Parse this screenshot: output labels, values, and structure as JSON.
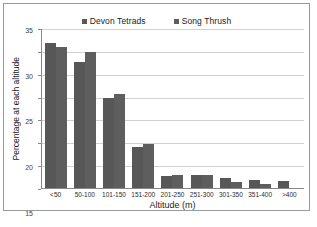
{
  "chart_data": {
    "type": "bar",
    "title": "",
    "xlabel": "Altitude (m)",
    "ylabel": "Percentage at each altitude",
    "categories": [
      "<50",
      "50-100",
      "101-150",
      "151-200",
      "201-250",
      "251-300",
      "301-350",
      "351-400",
      ">400"
    ],
    "series": [
      {
        "name": "Devon Tetrads",
        "color": "#575757",
        "values": [
          32.0,
          27.7,
          20.0,
          9.1,
          2.8,
          3.0,
          2.4,
          1.9,
          1.7
        ]
      },
      {
        "name": "Song Thrush",
        "color": "#5e5e5e",
        "values": [
          31.0,
          30.0,
          20.7,
          9.9,
          3.1,
          3.0,
          1.5,
          1.0,
          0.0
        ]
      }
    ],
    "ylim": [
      0,
      35
    ],
    "y_ticks": [
      0,
      5,
      10,
      15,
      20,
      25,
      30,
      35
    ],
    "y_tick_labels": [
      "0",
      "5",
      "10",
      "15",
      "20",
      "25",
      "30",
      "35"
    ],
    "grid": true,
    "legend_position": "top-center"
  }
}
